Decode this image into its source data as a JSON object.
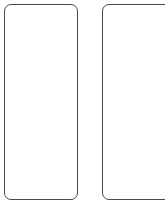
{
  "canvas": {
    "width": 165,
    "height": 221,
    "background_color": "#ffffff"
  },
  "style": {
    "border_color": "#4a4a4a",
    "border_width_px": 1.2,
    "corner_radius_px": 7,
    "fill_color": "#ffffff"
  },
  "shapes": [
    {
      "name": "left-panel",
      "type": "rounded-rectangle",
      "x": 4,
      "y": 3.5,
      "width": 74,
      "height": 196,
      "corner_radius": 7,
      "stroke": "#4a4a4a",
      "fill": "#ffffff",
      "clipped": false,
      "content": ""
    },
    {
      "name": "right-panel",
      "type": "rounded-rectangle",
      "x": 102,
      "y": 3.5,
      "width": 84,
      "height": 196,
      "corner_radius": 7,
      "stroke": "#4a4a4a",
      "fill": "#ffffff",
      "clipped": true,
      "content": ""
    }
  ]
}
